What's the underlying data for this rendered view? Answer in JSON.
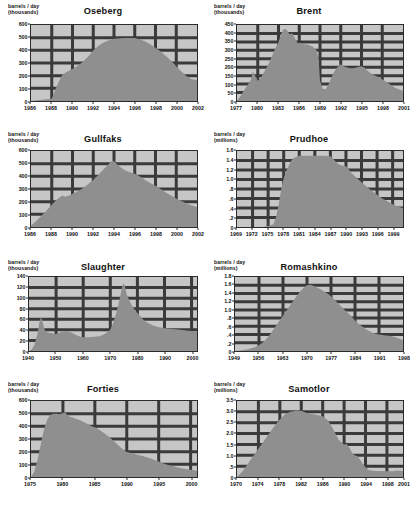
{
  "figure": {
    "panel_count": 8,
    "fill_color": "#8f8f8f",
    "plot_bg_color": "#c6c6c6",
    "grid_color": "#3a3a3a",
    "axis_color": "#2b2b2b",
    "page_bg_color": "#ffffff"
  },
  "chart_data": [
    {
      "type": "area",
      "title": "Oseberg",
      "ylabel": "barrels / day\n(thousands)",
      "xlabel": "",
      "units": "thousands",
      "grid": true,
      "legend": "none",
      "xlim": [
        1986,
        2002
      ],
      "ylim": [
        0,
        600
      ],
      "yticks": [
        0,
        100,
        200,
        300,
        400,
        500,
        600
      ],
      "ytick_labels": [
        "0",
        "100",
        "200",
        "300",
        "400",
        "500",
        "600"
      ],
      "xticks": [
        1986,
        1988,
        1990,
        1992,
        1994,
        1996,
        1998,
        2000,
        2002
      ],
      "xtick_labels": [
        "1986",
        "1988",
        "1990",
        "1992",
        "1994",
        "1996",
        "1998",
        "2000",
        "2002"
      ],
      "x": [
        1986,
        1987,
        1988,
        1988.5,
        1989,
        1989.5,
        1990,
        1990.5,
        1991,
        1991.5,
        1992,
        1992.5,
        1993,
        1993.5,
        1994,
        1995,
        1996,
        1996.5,
        1997,
        1997.5,
        1998,
        1998.5,
        1999,
        1999.5,
        2000,
        2000.5,
        2001,
        2001.5,
        2002
      ],
      "y": [
        0,
        10,
        18,
        120,
        205,
        232,
        252,
        278,
        310,
        350,
        398,
        437,
        462,
        480,
        492,
        497,
        497,
        487,
        470,
        448,
        420,
        390,
        355,
        318,
        275,
        232,
        195,
        172,
        165
      ]
    },
    {
      "type": "area",
      "title": "Brent",
      "ylabel": "barrels / day\n(thousands)",
      "xlabel": "",
      "units": "thousands",
      "grid": true,
      "legend": "none",
      "xlim": [
        1977,
        2001
      ],
      "ylim": [
        0,
        450
      ],
      "yticks": [
        0,
        50,
        100,
        150,
        200,
        250,
        300,
        350,
        400,
        450
      ],
      "ytick_labels": [
        "0",
        "50",
        "100",
        "150",
        "200",
        "250",
        "300",
        "350",
        "400",
        "450"
      ],
      "xticks": [
        1977,
        1980,
        1983,
        1986,
        1989,
        1992,
        1995,
        1998,
        2001
      ],
      "xtick_labels": [
        "1977",
        "1980",
        "1983",
        "1986",
        "1989",
        "1992",
        "1995",
        "1998",
        "2001"
      ],
      "x": [
        1977,
        1977.5,
        1978,
        1978.5,
        1979,
        1979.3,
        1979.6,
        1980,
        1980.5,
        1981,
        1981.5,
        1982,
        1982.5,
        1983,
        1983.4,
        1983.8,
        1984.2,
        1984.6,
        1985,
        1985.4,
        1985.8,
        1986,
        1986.4,
        1986.8,
        1987,
        1987.5,
        1988,
        1988.5,
        1988.8,
        1989,
        1989.4,
        1989.8,
        1990.2,
        1990.6,
        1991,
        1991.5,
        1992,
        1992.4,
        1992.8,
        1993.2,
        1993.6,
        1994,
        1994.5,
        1995,
        1995.5,
        1996,
        1996.5,
        1997,
        1997.5,
        1998,
        1998.5,
        1999,
        1999.5,
        2000,
        2000.5,
        2001
      ],
      "y": [
        0,
        30,
        62,
        92,
        125,
        175,
        150,
        120,
        140,
        178,
        215,
        260,
        310,
        350,
        400,
        428,
        420,
        395,
        400,
        370,
        340,
        345,
        340,
        335,
        336,
        330,
        320,
        300,
        250,
        120,
        72,
        70,
        95,
        135,
        170,
        200,
        218,
        205,
        200,
        195,
        192,
        195,
        202,
        205,
        195,
        175,
        160,
        150,
        140,
        128,
        115,
        102,
        88,
        75,
        68,
        60
      ]
    },
    {
      "type": "area",
      "title": "Gullfaks",
      "ylabel": "barrels / day\n(thousands)",
      "xlabel": "",
      "units": "thousands",
      "grid": true,
      "legend": "none",
      "xlim": [
        1986,
        2002
      ],
      "ylim": [
        0,
        600
      ],
      "yticks": [
        0,
        100,
        200,
        300,
        400,
        500,
        600
      ],
      "ytick_labels": [
        "0",
        "100",
        "200",
        "300",
        "400",
        "500",
        "600"
      ],
      "xticks": [
        1986,
        1988,
        1990,
        1992,
        1994,
        1996,
        1998,
        2000,
        2002
      ],
      "xtick_labels": [
        "1986",
        "1988",
        "1990",
        "1992",
        "1994",
        "1996",
        "1998",
        "2000",
        "2002"
      ],
      "x": [
        1986,
        1986.5,
        1987,
        1987.5,
        1988,
        1988.5,
        1989,
        1989.3,
        1989.7,
        1990,
        1990.5,
        1991,
        1991.5,
        1992,
        1992.5,
        1993,
        1993.5,
        1993.8,
        1994,
        1994.5,
        1995,
        1995.5,
        1996,
        1996.5,
        1997,
        1997.5,
        1998,
        1998.5,
        1999,
        1999.5,
        2000,
        2000.5,
        2001,
        2001.5,
        2002
      ],
      "y": [
        10,
        48,
        88,
        130,
        175,
        218,
        248,
        238,
        248,
        262,
        282,
        305,
        338,
        372,
        412,
        455,
        498,
        523,
        520,
        480,
        450,
        432,
        420,
        398,
        372,
        348,
        325,
        300,
        272,
        248,
        225,
        205,
        185,
        170,
        158
      ]
    },
    {
      "type": "area",
      "title": "Prudhoe",
      "ylabel": "barrels / day\n(millions)",
      "xlabel": "",
      "units": "millions",
      "grid": true,
      "legend": "none",
      "xlim": [
        1969,
        2001
      ],
      "ylim": [
        0,
        1.6
      ],
      "yticks": [
        0,
        0.2,
        0.4,
        0.6,
        0.8,
        1.0,
        1.2,
        1.4,
        1.6
      ],
      "ytick_labels": [
        "0",
        ".2",
        ".4",
        ".6",
        ".8",
        "1.0",
        "1.2",
        "1.4",
        "1.6"
      ],
      "xticks": [
        1969,
        1972,
        1975,
        1978,
        1981,
        1984,
        1987,
        1990,
        1993,
        1996,
        1999
      ],
      "xtick_labels": [
        "1969",
        "1972",
        "1975",
        "1978",
        "1981",
        "1984",
        "1987",
        "1990",
        "1993",
        "1996",
        "1999"
      ],
      "x": [
        1969,
        1974,
        1975,
        1976,
        1976.5,
        1977,
        1977.5,
        1978,
        1978.5,
        1979,
        1979.5,
        1980,
        1981,
        1982,
        1983,
        1984,
        1985,
        1986,
        1987,
        1987.5,
        1988,
        1988.5,
        1989,
        1990,
        1990.5,
        1991,
        1992,
        1993,
        1994,
        1995,
        1996,
        1997,
        1998,
        1999,
        2000,
        2001
      ],
      "y": [
        0,
        0,
        0.02,
        0.06,
        0.2,
        0.45,
        0.78,
        1.02,
        1.18,
        1.3,
        1.4,
        1.46,
        1.5,
        1.5,
        1.5,
        1.5,
        1.5,
        1.5,
        1.49,
        1.44,
        1.38,
        1.33,
        1.3,
        1.28,
        1.22,
        1.14,
        1.04,
        0.94,
        0.85,
        0.76,
        0.68,
        0.6,
        0.54,
        0.48,
        0.43,
        0.4
      ]
    },
    {
      "type": "area",
      "title": "Slaughter",
      "ylabel": "barrels / day\n(thousands)",
      "xlabel": "",
      "units": "thousands",
      "grid": true,
      "legend": "none",
      "xlim": [
        1940,
        2002
      ],
      "ylim": [
        0,
        140
      ],
      "yticks": [
        0,
        20,
        40,
        60,
        80,
        100,
        120,
        140
      ],
      "ytick_labels": [
        "0",
        "20",
        "40",
        "60",
        "80",
        "100",
        "120",
        "140"
      ],
      "xticks": [
        1940,
        1950,
        1960,
        1970,
        1980,
        1990,
        2000
      ],
      "xtick_labels": [
        "1940",
        "1950",
        "1960",
        "1970",
        "1980",
        "1990",
        "2000"
      ],
      "x": [
        1940,
        1941,
        1942,
        1943,
        1944,
        1944.5,
        1945,
        1945.5,
        1946,
        1947,
        1948,
        1949,
        1950,
        1951,
        1952,
        1953,
        1954,
        1955,
        1956,
        1957,
        1958,
        1959,
        1960,
        1962,
        1964,
        1966,
        1968,
        1970,
        1971,
        1972,
        1973,
        1974,
        1974.5,
        1975,
        1975.5,
        1976,
        1977,
        1978,
        1979,
        1980,
        1981,
        1982,
        1983,
        1984,
        1986,
        1988,
        1990,
        1992,
        1994,
        1996,
        1998,
        2000,
        2002
      ],
      "y": [
        0,
        3,
        12,
        30,
        58,
        64,
        55,
        45,
        38,
        35,
        34,
        33,
        32,
        34,
        36,
        37,
        37,
        36,
        34,
        31,
        29,
        27,
        26,
        26,
        27,
        28,
        32,
        40,
        52,
        68,
        88,
        112,
        124,
        128,
        120,
        108,
        96,
        86,
        78,
        72,
        66,
        60,
        56,
        53,
        48,
        45,
        43,
        42,
        41,
        40,
        39,
        38,
        37
      ]
    },
    {
      "type": "area",
      "title": "Romashkino",
      "ylabel": "barrels / day\n(millions)",
      "xlabel": "",
      "units": "millions",
      "grid": true,
      "legend": "none",
      "xlim": [
        1949,
        1998
      ],
      "ylim": [
        0,
        1.8
      ],
      "yticks": [
        0,
        0.2,
        0.4,
        0.6,
        0.8,
        1.0,
        1.2,
        1.4,
        1.6,
        1.8
      ],
      "ytick_labels": [
        "0",
        ".2",
        ".4",
        ".6",
        ".8",
        "1.0",
        "1.2",
        "1.4",
        "1.6",
        "1.8"
      ],
      "xticks": [
        1949,
        1956,
        1963,
        1970,
        1977,
        1984,
        1991,
        1998
      ],
      "xtick_labels": [
        "1949",
        "1956",
        "1963",
        "1970",
        "1977",
        "1984",
        "1991",
        "1998"
      ],
      "x": [
        1949,
        1951,
        1953,
        1955,
        1956,
        1957,
        1958,
        1959,
        1960,
        1961,
        1962,
        1963,
        1964,
        1965,
        1966,
        1967,
        1968,
        1969,
        1970,
        1971,
        1972,
        1973,
        1974,
        1975,
        1976,
        1977,
        1978,
        1979,
        1980,
        1981,
        1982,
        1983,
        1984,
        1985,
        1986,
        1987,
        1988,
        1989,
        1990,
        1991,
        1992,
        1993,
        1994,
        1995,
        1996,
        1997,
        1998
      ],
      "y": [
        0,
        0.02,
        0.05,
        0.1,
        0.14,
        0.2,
        0.28,
        0.38,
        0.5,
        0.62,
        0.74,
        0.86,
        0.98,
        1.1,
        1.22,
        1.34,
        1.45,
        1.54,
        1.6,
        1.61,
        1.58,
        1.54,
        1.5,
        1.45,
        1.4,
        1.33,
        1.25,
        1.17,
        1.08,
        1.0,
        0.92,
        0.84,
        0.74,
        0.66,
        0.6,
        0.54,
        0.49,
        0.45,
        0.42,
        0.4,
        0.39,
        0.38,
        0.37,
        0.35,
        0.33,
        0.3,
        0.27
      ]
    },
    {
      "type": "area",
      "title": "Forties",
      "ylabel": "barrels / day\n(thousands)",
      "xlabel": "",
      "units": "thousands",
      "grid": true,
      "legend": "none",
      "xlim": [
        1975,
        2001
      ],
      "ylim": [
        0,
        600
      ],
      "yticks": [
        0,
        100,
        200,
        300,
        400,
        500,
        600
      ],
      "ytick_labels": [
        "0",
        "100",
        "200",
        "300",
        "400",
        "500",
        "600"
      ],
      "xticks": [
        1975,
        1980,
        1985,
        1990,
        1995,
        2000
      ],
      "xtick_labels": [
        "1975",
        "1980",
        "1985",
        "1990",
        "1995",
        "2000"
      ],
      "x": [
        1975,
        1975.5,
        1976,
        1976.5,
        1977,
        1977.5,
        1978,
        1978.5,
        1979,
        1979.5,
        1980,
        1980.3,
        1980.6,
        1981,
        1981.5,
        1982,
        1982.5,
        1983,
        1983.5,
        1984,
        1984.5,
        1985,
        1985.5,
        1986,
        1986.5,
        1987,
        1987.5,
        1988,
        1988.5,
        1989,
        1989.5,
        1990,
        1990.5,
        1991,
        1991.5,
        1992,
        1992.5,
        1993,
        1993.5,
        1994,
        1994.5,
        1995,
        1995.5,
        1996,
        1996.5,
        1997,
        1997.5,
        1998,
        1998.5,
        1999,
        1999.5,
        2000,
        2000.5,
        2001
      ],
      "y": [
        0,
        40,
        130,
        250,
        370,
        450,
        490,
        500,
        500,
        495,
        505,
        512,
        495,
        478,
        470,
        460,
        452,
        440,
        428,
        414,
        400,
        392,
        378,
        362,
        345,
        325,
        305,
        282,
        258,
        235,
        215,
        198,
        192,
        185,
        178,
        172,
        165,
        158,
        150,
        142,
        132,
        122,
        112,
        102,
        95,
        88,
        82,
        75,
        70,
        66,
        62,
        58,
        54,
        50
      ]
    },
    {
      "type": "area",
      "title": "Samotlor",
      "ylabel": "barrels / day\n(millions)",
      "xlabel": "",
      "units": "millions",
      "grid": true,
      "legend": "none",
      "xlim": [
        1970,
        2001
      ],
      "ylim": [
        0,
        3.5
      ],
      "yticks": [
        0,
        0.5,
        1.0,
        1.5,
        2.0,
        2.5,
        3.0,
        3.5
      ],
      "ytick_labels": [
        "0",
        ".5",
        "1.0",
        "1.5",
        "2.0",
        "2.5",
        "3.0",
        "3.5"
      ],
      "xticks": [
        1970,
        1974,
        1978,
        1982,
        1986,
        1990,
        1994,
        1998,
        2001
      ],
      "xtick_labels": [
        "1970",
        "1974",
        "1978",
        "1982",
        "1986",
        "1990",
        "1994",
        "1998",
        "2001"
      ],
      "x": [
        1970,
        1971,
        1972,
        1973,
        1974,
        1975,
        1976,
        1977,
        1978,
        1979,
        1980,
        1981,
        1982,
        1983,
        1984,
        1985,
        1986,
        1987,
        1988,
        1988.5,
        1989,
        1989.5,
        1990,
        1990.5,
        1991,
        1991.5,
        1992,
        1992.5,
        1993,
        1993.5,
        1994,
        1994.5,
        1995,
        1996,
        1997,
        1998,
        1999,
        2000,
        2001
      ],
      "y": [
        0,
        0.25,
        0.6,
        0.95,
        1.3,
        1.65,
        2.0,
        2.35,
        2.65,
        2.9,
        3.0,
        3.05,
        3.05,
        2.95,
        2.9,
        2.85,
        2.8,
        2.6,
        2.2,
        1.95,
        1.72,
        1.6,
        1.5,
        1.52,
        1.35,
        1.1,
        1.0,
        0.95,
        0.8,
        0.6,
        0.45,
        0.33,
        0.3,
        0.28,
        0.28,
        0.27,
        0.27,
        0.3,
        0.28
      ]
    }
  ]
}
